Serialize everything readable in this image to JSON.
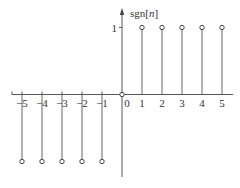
{
  "chart_data": {
    "type": "stem",
    "title": "",
    "xlabel": "",
    "ylabel": "sgn[n]",
    "x": [
      -5,
      -4,
      -3,
      -2,
      -1,
      0,
      1,
      2,
      3,
      4,
      5
    ],
    "values": [
      -1,
      -1,
      -1,
      -1,
      -1,
      0,
      1,
      1,
      1,
      1,
      1
    ],
    "x_tick_labels": [
      "−5",
      "−4",
      "−3",
      "−2",
      "−1",
      "0",
      "1",
      "2",
      "3",
      "4",
      "5"
    ],
    "y_tick_labels": [
      "1"
    ],
    "xlim": [
      -5.5,
      5.5
    ],
    "ylim": [
      -1,
      1
    ],
    "grid": false,
    "legend": null,
    "marker": "open-circle"
  },
  "layout": {
    "origin_x": 122,
    "origin_y": 94.5,
    "unit_x": 20,
    "unit_y": 67,
    "axis_x_start": 12,
    "axis_x_end": 233,
    "axis_y_top": 8,
    "axis_y_bottom": 177
  },
  "colors": {
    "axis": "#444444",
    "stem": "#555555",
    "text": "#333333"
  }
}
